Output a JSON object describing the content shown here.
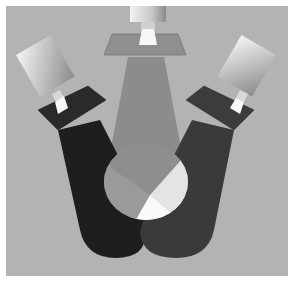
{
  "figure": {
    "colors": {
      "frame_border": "#ffffff",
      "background": "#b3b3b3",
      "left_beam": "#1e1e1e",
      "right_beam": "#3a3a3a",
      "center_beam": "#8c8c8c",
      "center_spot": "#a8a8a8",
      "overlap_light": "#e0e0e0",
      "overlap_white": "#fafafa",
      "left_filter": "#2a2a2a",
      "right_filter": "#3c3c3c",
      "center_filter": "#8f8f8f"
    },
    "lights": [
      {
        "name": "left",
        "angle": -30
      },
      {
        "name": "center",
        "angle": 0
      },
      {
        "name": "right",
        "angle": 30
      }
    ]
  }
}
